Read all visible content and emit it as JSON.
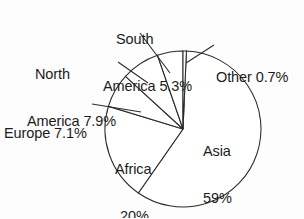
{
  "chart_data": {
    "type": "pie",
    "title": "",
    "categories": [
      "Other",
      "Asia",
      "Africa",
      "Europe",
      "North America",
      "South America"
    ],
    "values": [
      0.7,
      59,
      20,
      7.1,
      7.9,
      5.3
    ],
    "value_unit": "%",
    "start_angle_deg": 0,
    "direction": "clockwise",
    "legend": "none",
    "grid": false,
    "slices": [
      {
        "name": "Other",
        "label": "Other 0.7%",
        "value": 0.7,
        "label_placement": "outside",
        "start_deg": 0.0,
        "end_deg": 2.52
      },
      {
        "name": "Asia",
        "label": "Asia 59%",
        "value": 59,
        "label_placement": "inside",
        "start_deg": 2.52,
        "end_deg": 214.92
      },
      {
        "name": "Africa",
        "label": "Africa 20%",
        "value": 20,
        "label_placement": "inside",
        "start_deg": 214.92,
        "end_deg": 286.92
      },
      {
        "name": "Europe",
        "label": "Europe 7.1%",
        "value": 7.1,
        "label_placement": "outside",
        "start_deg": 286.92,
        "end_deg": 312.48
      },
      {
        "name": "North America",
        "label": "North America 7.9%",
        "value": 7.9,
        "label_placement": "outside",
        "start_deg": 312.48,
        "end_deg": 340.92
      },
      {
        "name": "South America",
        "label": "South America 5.3%",
        "value": 5.3,
        "label_placement": "outside",
        "start_deg": 340.92,
        "end_deg": 360.0
      }
    ]
  },
  "labels": {
    "south_america": {
      "line1": "South",
      "line2": "America 5.3%"
    },
    "north_america": {
      "line1": "North",
      "line2": "America 7.9%"
    },
    "europe": {
      "line1": "Europe 7.1%"
    },
    "other": {
      "line1": "Other 0.7%"
    },
    "asia": {
      "line1": "Asia",
      "line2": "59%"
    },
    "africa": {
      "line1": "Africa",
      "line2": "20%"
    }
  },
  "style": {
    "stroke_color": "#2a2a2a",
    "fill_color": "#ffffff",
    "background": "#fdfdfd",
    "text_color": "#1c1c1c"
  }
}
